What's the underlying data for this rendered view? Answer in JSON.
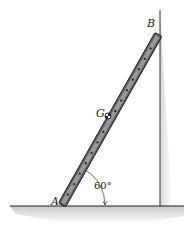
{
  "labels": {
    "A": "A",
    "B": "B",
    "G": "G"
  },
  "angle": "60°"
}
